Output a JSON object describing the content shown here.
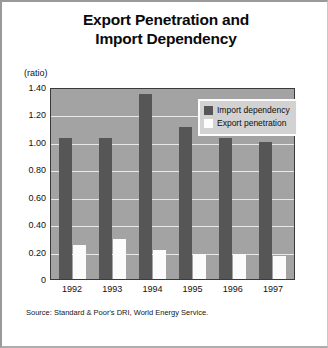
{
  "title": {
    "line1": "Export Penetration and",
    "line2": "Import Dependency"
  },
  "axis_unit_label": "(ratio)",
  "source_note": "Source: Standard & Poor's DRI, World Energy Service.",
  "legend": {
    "import_label": "Import dependency",
    "export_label": "Export penetration"
  },
  "colors": {
    "import_bar": "#565656",
    "export_bar": "#fbfbfb",
    "plot_background": "#a3a3a3",
    "gridline": "#e8e8e8",
    "legend_background": "#d2d2d2",
    "text": "#111111"
  },
  "y_ticks": [
    "1.40",
    "1.20",
    "1.00",
    "0.80",
    "0.60",
    "0.40",
    "0.20",
    "0"
  ],
  "chart_data": {
    "type": "bar",
    "title": "Export Penetration and Import Dependency",
    "xlabel": "",
    "ylabel": "(ratio)",
    "ylim": [
      0,
      1.4
    ],
    "ytick_values": [
      0,
      0.2,
      0.4,
      0.6,
      0.8,
      1.0,
      1.2,
      1.4
    ],
    "grid": true,
    "legend_position": "top-right",
    "categories": [
      "1992",
      "1993",
      "1994",
      "1995",
      "1996",
      "1997"
    ],
    "series": [
      {
        "name": "Import dependency",
        "color": "#565656",
        "values": [
          1.03,
          1.03,
          1.35,
          1.11,
          1.03,
          1.0
        ]
      },
      {
        "name": "Export penetration",
        "color": "#fbfbfb",
        "values": [
          0.25,
          0.29,
          0.21,
          0.18,
          0.18,
          0.17
        ]
      }
    ]
  }
}
